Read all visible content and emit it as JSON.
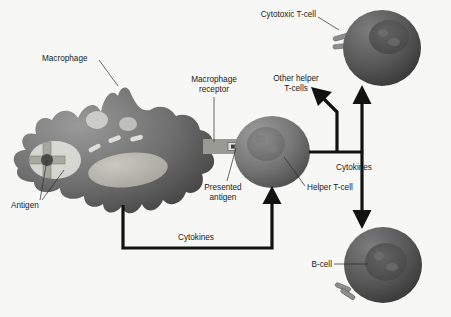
{
  "figure": {
    "background_color": "#f7f7f5",
    "line_color": "#121212",
    "label_color": "#1a1a1a"
  },
  "labels": {
    "macrophage": "Macrophage",
    "antigen": "Antigen",
    "macrophage_receptor_line1": "Macrophage",
    "macrophage_receptor_line2": "receptor",
    "presented_antigen_line1": "Presented",
    "presented_antigen_line2": "antigen",
    "other_helper_line1": "Other helper",
    "other_helper_line2": "T-cells",
    "cytotoxic_tcell": "Cytotoxic T-cell",
    "helper_tcell": "Helper T-cell",
    "bcell": "B-cell",
    "cytokines_bottom": "Cytokines",
    "cytokines_right": "Cytokines"
  },
  "cells": {
    "macrophage": {
      "name": "Macrophage",
      "fill_light": "#8f8f8f",
      "fill_dark": "#4a4a4a",
      "nucleus_fill": "#b9b9b3",
      "antigen_fragments": 3
    },
    "helper_tcell": {
      "name": "Helper T-cell",
      "fill_light": "#8a8a8a",
      "fill_dark": "#4f4f4f",
      "nucleus_fill": "#6e6e6e"
    },
    "cytotoxic_tcell": {
      "name": "Cytotoxic T-cell",
      "fill_light": "#6a6a6a",
      "fill_dark": "#3a3a3a",
      "nucleus_fill": "#555555",
      "receptors": 2
    },
    "bcell": {
      "name": "B-cell",
      "fill_light": "#6a6a6a",
      "fill_dark": "#3a3a3a",
      "nucleus_fill": "#4d4d4d",
      "receptors": 2
    },
    "antigen_particle": {
      "shape": "cross",
      "arm_fill": "#a8a8a2",
      "core_fill": "#4a4a4a"
    },
    "receptor_bridge": {
      "fill": "#9a9a94",
      "presented_antigen_fill": "#3c3c3c"
    }
  },
  "flows": [
    {
      "id": "cytokines-to-helper",
      "label": "Cytokines",
      "from": "Macrophage",
      "to": "Helper T-cell"
    },
    {
      "id": "cytokines-to-cytotoxic",
      "label": "Cytokines",
      "from": "Helper T-cell",
      "to": "Cytotoxic T-cell"
    },
    {
      "id": "cytokines-to-bcell",
      "label": "Cytokines",
      "from": "Helper T-cell",
      "to": "B-cell"
    },
    {
      "id": "cytokines-to-other-helper",
      "label": "Cytokines",
      "from": "Helper T-cell",
      "to": "Other helper T-cells"
    }
  ]
}
